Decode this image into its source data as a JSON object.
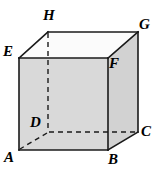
{
  "figure": {
    "name": "cube-diagram",
    "type": "geometric-solid",
    "solid": "cube",
    "background_color": "#ffffff",
    "stroke_color": "#1a1a1a",
    "colors": {
      "front_face_fill": "#d9d9d9",
      "top_face_fill": "#fbfbfb",
      "right_face_fill": "#d2d2d2",
      "edge_stroke": "#1a1a1a",
      "hidden_edge_stroke": "#1a1a1a"
    },
    "geometry": {
      "front_face": {
        "E": [
          19,
          58
        ],
        "F": [
          108,
          58
        ],
        "B": [
          108,
          150
        ],
        "A": [
          19,
          150
        ]
      },
      "back_face": {
        "H": [
          48,
          32
        ],
        "G": [
          138,
          32
        ],
        "C": [
          138,
          132
        ],
        "D": [
          48,
          132
        ]
      }
    },
    "vertices": [
      {
        "id": "A",
        "label": "A",
        "x": 19,
        "y": 150,
        "label_x": 4,
        "label_y": 150,
        "hidden": false
      },
      {
        "id": "B",
        "label": "B",
        "x": 108,
        "y": 150,
        "label_x": 108,
        "label_y": 152,
        "hidden": false
      },
      {
        "id": "C",
        "label": "C",
        "x": 138,
        "y": 132,
        "label_x": 141,
        "label_y": 124,
        "hidden": false
      },
      {
        "id": "D",
        "label": "D",
        "x": 48,
        "y": 132,
        "label_x": 30,
        "label_y": 115,
        "hidden": true
      },
      {
        "id": "E",
        "label": "E",
        "x": 19,
        "y": 58,
        "label_x": 3,
        "label_y": 44,
        "hidden": false
      },
      {
        "id": "F",
        "label": "F",
        "x": 108,
        "y": 58,
        "label_x": 108,
        "label_y": 56,
        "hidden": false
      },
      {
        "id": "G",
        "label": "G",
        "x": 138,
        "y": 32,
        "label_x": 139,
        "label_y": 17,
        "hidden": false
      },
      {
        "id": "H",
        "label": "H",
        "x": 48,
        "y": 32,
        "label_x": 43,
        "label_y": 8,
        "hidden": false
      }
    ],
    "edges": {
      "visible": [
        "E-F",
        "F-B",
        "B-A",
        "A-E",
        "E-H",
        "F-G",
        "B-C",
        "H-G",
        "G-C"
      ],
      "hidden_dashed": [
        "H-D",
        "D-C",
        "D-A"
      ]
    },
    "labels": {
      "A": "A",
      "B": "B",
      "C": "C",
      "D": "D",
      "E": "E",
      "F": "F",
      "G": "G",
      "H": "H"
    }
  }
}
